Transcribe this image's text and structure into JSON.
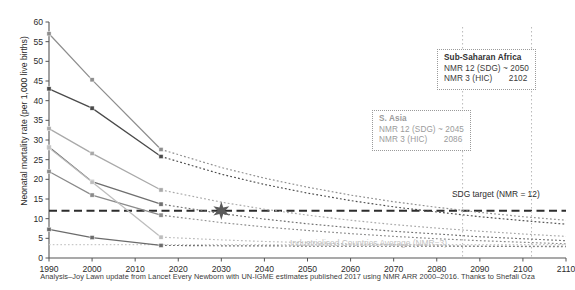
{
  "chart_data": {
    "type": "line",
    "title": "",
    "xlabel": "",
    "ylabel": "Neonatal mortality rate (per 1,000 live births)",
    "xlim": [
      1990,
      2110
    ],
    "ylim": [
      0,
      60
    ],
    "xticks": [
      1990,
      2000,
      2010,
      2020,
      2030,
      2040,
      2050,
      2060,
      2070,
      2080,
      2090,
      2100,
      2110
    ],
    "yticks": [
      0,
      5,
      10,
      15,
      20,
      25,
      30,
      35,
      40,
      45,
      50,
      55,
      60
    ],
    "grid": false,
    "legend": "none",
    "x_observed": [
      1990,
      2000,
      2016
    ],
    "series": [
      {
        "name": "series-1",
        "color": "#8e8e8e",
        "values": [
          57.0,
          45.3,
          27.6
        ],
        "projection_x": [
          2016,
          2030,
          2040,
          2050,
          2060,
          2070,
          2080,
          2090,
          2100,
          2110
        ],
        "projection_y": [
          27.6,
          23.0,
          20.3,
          18.0,
          16.0,
          14.3,
          12.9,
          11.6,
          10.5,
          9.6
        ]
      },
      {
        "name": "series-2",
        "color": "#4a4a4a",
        "values": [
          43.0,
          38.1,
          25.8
        ],
        "projection_x": [
          2016,
          2030,
          2040,
          2050,
          2060,
          2070,
          2080,
          2090,
          2100,
          2110
        ],
        "projection_y": [
          25.8,
          21.3,
          18.7,
          16.5,
          14.6,
          13.0,
          11.7,
          10.5,
          9.5,
          8.6
        ]
      },
      {
        "name": "series-3",
        "color": "#a9a9a9",
        "values": [
          32.9,
          26.6,
          17.3
        ],
        "projection_x": [
          2016,
          2030,
          2040,
          2050,
          2060,
          2070,
          2080,
          2090,
          2100,
          2110
        ],
        "projection_y": [
          17.3,
          14.2,
          12.4,
          10.9,
          9.6,
          8.5,
          7.6,
          6.8,
          6.1,
          5.5
        ]
      },
      {
        "name": "series-4",
        "color": "#6f6f6f",
        "values": [
          28.2,
          19.4,
          13.7
        ],
        "projection_x": [
          2016,
          2030,
          2040,
          2050,
          2060,
          2070,
          2080,
          2090,
          2100,
          2110
        ],
        "projection_y": [
          13.7,
          11.3,
          9.9,
          8.7,
          7.7,
          6.8,
          6.1,
          5.4,
          4.9,
          4.4
        ]
      },
      {
        "name": "series-5",
        "color": "#8a8a8a",
        "values": [
          22.0,
          16.0,
          10.9
        ],
        "projection_x": [
          2016,
          2030,
          2040,
          2050,
          2060,
          2070,
          2080,
          2090,
          2100,
          2110
        ],
        "projection_y": [
          10.9,
          9.0,
          7.9,
          7.0,
          6.2,
          5.5,
          4.9,
          4.4,
          4.0,
          3.6
        ]
      },
      {
        "name": "series-6",
        "color": "#bdbdbd",
        "values": [
          28.0,
          19.3,
          5.3
        ],
        "projection_x": [
          2016,
          2030,
          2040,
          2050,
          2060,
          2070,
          2080,
          2090,
          2100,
          2110
        ],
        "projection_y": [
          5.3,
          4.6,
          4.2,
          3.9,
          3.6,
          3.4,
          3.2,
          3.0,
          2.9,
          2.8
        ]
      },
      {
        "name": "series-7",
        "color": "#6b6b6b",
        "values": [
          7.3,
          5.2,
          3.2
        ],
        "projection_x": [
          2016,
          2030,
          2040,
          2050,
          2060,
          2070,
          2080,
          2090,
          2100,
          2110
        ],
        "projection_y": [
          3.2,
          3.1,
          3.1,
          3.0,
          3.0,
          3.0,
          3.0,
          3.0,
          3.0,
          3.0
        ]
      }
    ],
    "reference_lines": [
      {
        "name": "sdg-target",
        "y": 12,
        "style": "dashed",
        "color": "#2d2d2d",
        "label": "SDG target (NMR = 12)"
      },
      {
        "name": "industrialised-average",
        "y": 3.4,
        "style": "dotted",
        "color": "#c9c9c9",
        "label": "Industrialised Countries Average (NMR=3)"
      }
    ],
    "vertical_guides": [
      {
        "name": "guide-2086",
        "x": 2086,
        "style": "dotted",
        "color": "#b9b9b9"
      },
      {
        "name": "guide-2102",
        "x": 2102,
        "style": "dotted",
        "color": "#b9b9b9"
      }
    ],
    "star_marker": {
      "name": "sdg-crossing-star",
      "x": 2030,
      "y": 12,
      "color": "#5a5a5a"
    },
    "annotations": [
      {
        "name": "sub-saharan-africa",
        "title": "Sub-Saharan Africa",
        "rows": [
          {
            "label": "NMR 12 (SDG) ~ 2050",
            "value": ""
          },
          {
            "label": "NMR 3 (HIC)",
            "value": "2102"
          }
        ]
      },
      {
        "name": "south-asia",
        "title": "S. Asia",
        "rows": [
          {
            "label": "NMR 12 (SDG) ~ 2045",
            "value": ""
          },
          {
            "label": "NMR 3 (HIC)",
            "value": "2086"
          }
        ]
      }
    ]
  },
  "caption": "Analysis–Joy Lawn update from Lancet Every Newborn with UN-IGME estimates published 2017 using NMR ARR 2000–2016. Thanks to Shefali Oza",
  "labels": {
    "sdg_target": "SDG target (NMR = 12)",
    "industrialised": "Industrialised Countries Average (NMR=3)",
    "ylabel": "Neonatal mortality rate (per 1,000 live births)"
  }
}
